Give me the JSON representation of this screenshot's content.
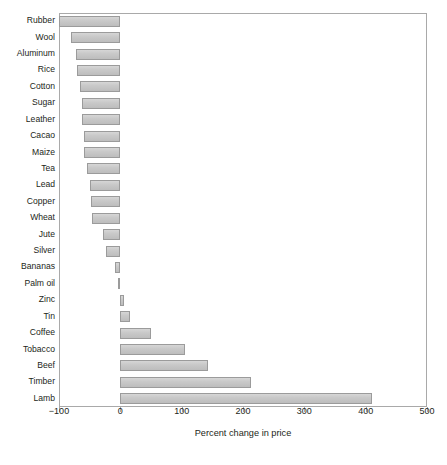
{
  "chart_data": {
    "type": "bar",
    "orientation": "horizontal",
    "title": "",
    "xlabel": "Percent change in price",
    "ylabel": "",
    "xlim": [
      -100,
      500
    ],
    "xticks": [
      -100,
      0,
      100,
      200,
      300,
      400,
      500
    ],
    "xtick_labels": [
      "−100",
      "0",
      "100",
      "200",
      "300",
      "400",
      "500"
    ],
    "grid": false,
    "legend": null,
    "bar_color": "#c9c9c9",
    "bar_edge_color": "#9b9b9b",
    "frame_color": "#a9a9a9",
    "categories": [
      "Rubber",
      "Wool",
      "Aluminum",
      "Rice",
      "Cotton",
      "Sugar",
      "Leather",
      "Cacao",
      "Maize",
      "Tea",
      "Lead",
      "Copper",
      "Wheat",
      "Jute",
      "Silver",
      "Bananas",
      "Palm oil",
      "Zinc",
      "Tin",
      "Coffee",
      "Tobacco",
      "Beef",
      "Timber",
      "Lamb"
    ],
    "values": [
      -100,
      -80,
      -73,
      -70,
      -65,
      -63,
      -62,
      -60,
      -59,
      -55,
      -49,
      -48,
      -47,
      -29,
      -23,
      -9,
      -3,
      6,
      16,
      50,
      105,
      143,
      213,
      410
    ]
  }
}
